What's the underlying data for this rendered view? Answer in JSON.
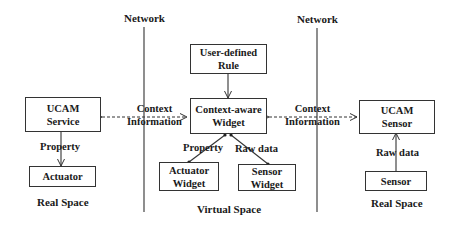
{
  "diagram": {
    "network_labels": [
      "Network",
      "Network"
    ],
    "boxes": {
      "ucam_service": "UCAM\nService",
      "actuator": "Actuator",
      "user_defined_rule": "User-defined\nRule",
      "context_aware_widget": "Context-aware\nWidget",
      "actuator_widget": "Actuator\nWidget",
      "sensor_widget": "Sensor\nWidget",
      "ucam_sensor": "UCAM\nSensor",
      "sensor": "Sensor"
    },
    "box_lines": {
      "ucam_service": [
        "UCAM",
        "Service"
      ],
      "user_defined_rule": [
        "User-defined",
        "Rule"
      ],
      "context_aware_widget": [
        "Context-aware",
        "Widget"
      ],
      "actuator_widget": [
        "Actuator",
        "Widget"
      ],
      "sensor_widget": [
        "Sensor",
        "Widget"
      ],
      "ucam_sensor": [
        "UCAM",
        "Sensor"
      ]
    },
    "edge_labels": {
      "context_left": [
        "Context",
        "Information"
      ],
      "context_right": [
        "Context",
        "Information"
      ],
      "property_left": "Property",
      "property_center": "Property",
      "raw_data_center": "Raw data",
      "raw_data_right": "Raw data"
    },
    "space_labels": {
      "left": "Real Space",
      "center": "Virtual Space",
      "right": "Real Space"
    },
    "colors": {
      "line": "#333333",
      "text": "#1a1a1a",
      "background": "#ffffff"
    }
  }
}
